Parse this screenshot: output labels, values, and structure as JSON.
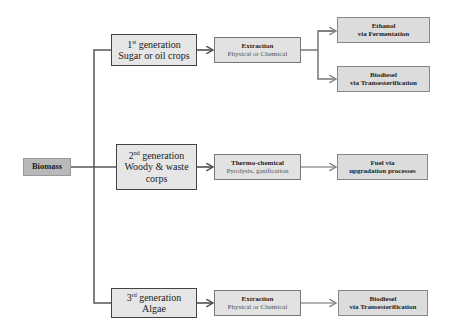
{
  "diagram": {
    "root": {
      "label": "Biomass"
    },
    "generations": [
      {
        "ordinal": "1",
        "suffix": "st",
        "title": "generation",
        "feedstock": "Sugar or oil crops",
        "process": {
          "title": "Extraction",
          "subtitle": "Physical or Chemical"
        },
        "outputs": [
          {
            "line1": "Ethanol",
            "line2": "via Fermentation"
          },
          {
            "line1": "Biodiesel",
            "line2": "via Transesterification"
          }
        ]
      },
      {
        "ordinal": "2",
        "suffix": "nd",
        "title": "generation",
        "feedstock": "Woody & waste corps",
        "process": {
          "title": "Thermo-chemical",
          "subtitle": "Pyrolysis, gasification"
        },
        "outputs": [
          {
            "line1": "Fuel via",
            "line2": "upgradation processes"
          }
        ]
      },
      {
        "ordinal": "3",
        "suffix": "rd",
        "title": "generation",
        "feedstock": "Algae",
        "process": {
          "title": "Extraction",
          "subtitle": "Physical or Chemical"
        },
        "outputs": [
          {
            "line1": "Biodiesel",
            "line2": "via Transesterification"
          }
        ]
      }
    ],
    "colors": {
      "line": "#555555",
      "root_fill": "#b9b9b9",
      "box_fill": "#e6e6e6",
      "output_fill": "#dcdcdc"
    }
  }
}
